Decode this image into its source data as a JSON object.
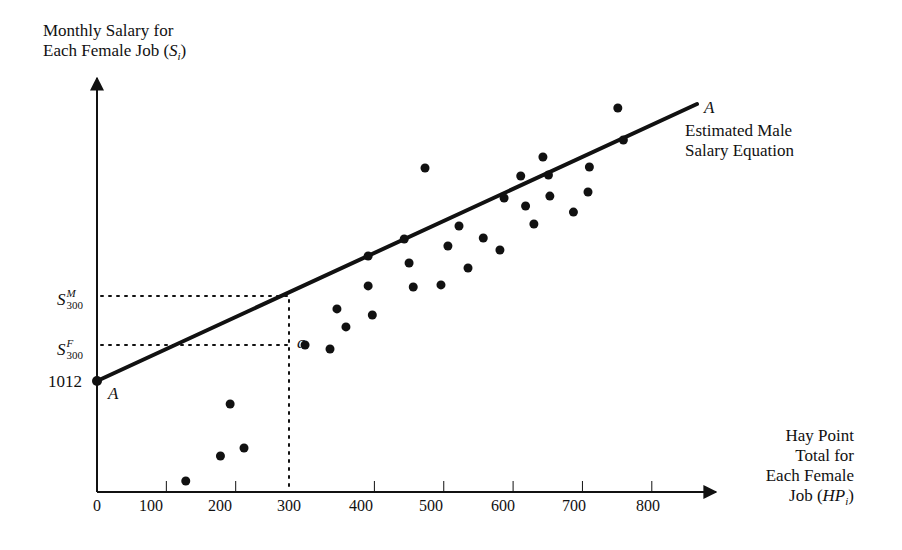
{
  "chart_data": {
    "type": "scatter",
    "title": "",
    "ylabel": "Monthly Salary for Each Female Job (S_i)",
    "ylabel_lines": [
      "Monthly Salary for",
      "Each Female Job ("
    ],
    "ylabel_symbol": "S",
    "ylabel_sub": "i",
    "xlabel": "Hay Point Total for Each Female Job (HP_i)",
    "xlabel_lines": [
      "Hay Point",
      "Total for",
      "Each Female",
      "Job ("
    ],
    "xlabel_symbol": "HP",
    "xlabel_sub": "i",
    "x_ticks": [
      0,
      100,
      200,
      300,
      400,
      500,
      600,
      700,
      800
    ],
    "xlim": [
      0,
      880
    ],
    "y_tick_labels": [
      "1012"
    ],
    "y_intercept": 1012,
    "grid": false,
    "line": {
      "name": "Estimated Male Salary Equation",
      "label_lines": [
        "Estimated Male",
        "Salary Equation"
      ],
      "endpoint_label": "A",
      "start": {
        "hp": 0,
        "salary": 1012
      },
      "end": {
        "hp": 865,
        "salary": 3537
      }
    },
    "reference_lines": {
      "hp": 300,
      "s_male_label": "S",
      "s_male_sup": "M",
      "s_male_sub": "300",
      "s_male_value": 3523,
      "s_female_label": "S",
      "s_female_sup": "F",
      "s_female_sub": "300",
      "s_female_value": 1340,
      "point_label": "a"
    },
    "points": [
      {
        "hp": 128,
        "salary": 100
      },
      {
        "hp": 178,
        "salary": 328
      },
      {
        "hp": 192,
        "salary": 802
      },
      {
        "hp": 212,
        "salary": 401
      },
      {
        "hp": 300,
        "salary": 1340
      },
      {
        "hp": 336,
        "salary": 1304
      },
      {
        "hp": 346,
        "salary": 1669
      },
      {
        "hp": 359,
        "salary": 1505
      },
      {
        "hp": 391,
        "salary": 2152
      },
      {
        "hp": 391,
        "salary": 1879
      },
      {
        "hp": 397,
        "salary": 1614
      },
      {
        "hp": 443,
        "salary": 2307
      },
      {
        "hp": 450,
        "salary": 2088
      },
      {
        "hp": 456,
        "salary": 1869
      },
      {
        "hp": 473,
        "salary": 2954
      },
      {
        "hp": 496,
        "salary": 1888
      },
      {
        "hp": 506,
        "salary": 2243
      },
      {
        "hp": 522,
        "salary": 2425
      },
      {
        "hp": 535,
        "salary": 2042
      },
      {
        "hp": 557,
        "salary": 2316
      },
      {
        "hp": 581,
        "salary": 2206
      },
      {
        "hp": 587,
        "salary": 2680
      },
      {
        "hp": 611,
        "salary": 2881
      },
      {
        "hp": 618,
        "salary": 2607
      },
      {
        "hp": 630,
        "salary": 2443
      },
      {
        "hp": 643,
        "salary": 3054
      },
      {
        "hp": 651,
        "salary": 2890
      },
      {
        "hp": 653,
        "salary": 2698
      },
      {
        "hp": 687,
        "salary": 2552
      },
      {
        "hp": 708,
        "salary": 2735
      },
      {
        "hp": 710,
        "salary": 2963
      },
      {
        "hp": 751,
        "salary": 3501
      },
      {
        "hp": 759,
        "salary": 3209
      }
    ]
  },
  "labels": {
    "intercept_point": "A",
    "intercept_value": "1012"
  }
}
